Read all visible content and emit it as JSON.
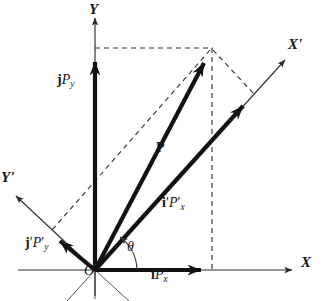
{
  "figure": {
    "kind": "vector-decomposition-diagram",
    "width": 322,
    "height": 301,
    "background_color": "#ffffff",
    "ink_color": "#171717",
    "thin_line_color": "#444444"
  },
  "axes": [
    {
      "id": "x-axis",
      "label": "X",
      "label_x": 302,
      "label_y": 262,
      "from": [
        18,
        270
      ],
      "to": [
        295,
        270
      ],
      "arrow": "end",
      "style": "thin-solid"
    },
    {
      "id": "y-axis",
      "label": "Y",
      "label_x": 89,
      "label_y": 3,
      "from": [
        95,
        296
      ],
      "to": [
        95,
        14
      ],
      "arrow": "end",
      "style": "thin-solid"
    },
    {
      "id": "x-prime-axis",
      "label": "X'",
      "label_x": 290,
      "label_y": 44,
      "from": [
        95,
        270
      ],
      "to": [
        287,
        58
      ],
      "arrow": "end",
      "style": "thin-solid"
    },
    {
      "id": "y-prime-axis",
      "label": "Y'",
      "label_x": 2,
      "label_y": 177,
      "from": [
        95,
        270
      ],
      "to": [
        13,
        193
      ],
      "arrow": "end",
      "style": "thin-solid"
    }
  ],
  "origin": {
    "label": "O",
    "x": 95,
    "y": 270,
    "label_x": 85,
    "label_y": 272
  },
  "angle": {
    "symbol": "θ",
    "label_x": 128,
    "label_y": 246,
    "vertex": [
      95,
      270
    ],
    "from_axis": "x-axis",
    "to_vector": "i'P'x",
    "radius": 40
  },
  "vectors": [
    {
      "id": "P",
      "label_plain": "P",
      "label_x": 157,
      "label_y": 148,
      "from": [
        95,
        270
      ],
      "to": [
        212,
        48
      ],
      "style": "thick-solid",
      "arrow": "end"
    },
    {
      "id": "iPx",
      "label_x": 152,
      "label_y": 275,
      "parts": [
        {
          "text": "i",
          "style": "bold"
        },
        {
          "text": "P",
          "style": "italic"
        },
        {
          "text": "x",
          "style": "subscript"
        }
      ],
      "from": [
        95,
        270
      ],
      "to": [
        212,
        270
      ],
      "style": "thick-solid",
      "arrow": "end"
    },
    {
      "id": "jPy",
      "label_x": 58,
      "label_y": 80,
      "parts": [
        {
          "text": "j",
          "style": "bold"
        },
        {
          "text": "P",
          "style": "italic"
        },
        {
          "text": "y",
          "style": "subscript"
        }
      ],
      "from": [
        95,
        270
      ],
      "to": [
        95,
        49
      ],
      "style": "thick-solid",
      "arrow": "end"
    },
    {
      "id": "i'P'x",
      "label_x": 163,
      "label_y": 203,
      "parts": [
        {
          "text": "i",
          "style": "bold"
        },
        {
          "text": "'",
          "style": "prime"
        },
        {
          "text": "P",
          "style": "italic"
        },
        {
          "text": "'",
          "style": "prime"
        },
        {
          "text": "x",
          "style": "subscript"
        }
      ],
      "from": [
        95,
        270
      ],
      "to": [
        252,
        96
      ],
      "style": "thick-solid",
      "arrow": "end"
    },
    {
      "id": "j'P'y",
      "label_x": 26,
      "label_y": 243,
      "parts": [
        {
          "text": "j",
          "style": "bold"
        },
        {
          "text": "'",
          "style": "prime"
        },
        {
          "text": "P",
          "style": "italic"
        },
        {
          "text": "'",
          "style": "prime"
        },
        {
          "text": "y",
          "style": "subscript"
        }
      ],
      "from": [
        95,
        270
      ],
      "to": [
        50,
        232
      ],
      "style": "thick-solid",
      "arrow": "end"
    }
  ],
  "construction_lines": [
    {
      "id": "dash-top-horizontal",
      "from": [
        95,
        48
      ],
      "to": [
        212,
        48
      ],
      "style": "dashed"
    },
    {
      "id": "dash-right-vertical",
      "from": [
        212,
        48
      ],
      "to": [
        212,
        270
      ],
      "style": "dashed"
    },
    {
      "id": "dash-p-to-jpy-prime",
      "from": [
        212,
        48
      ],
      "to": [
        50,
        232
      ],
      "style": "dashed"
    },
    {
      "id": "dash-p-to-ipx-prime",
      "from": [
        212,
        48
      ],
      "to": [
        253,
        95
      ],
      "style": "dashed"
    }
  ],
  "negative_axis_stubs": [
    {
      "id": "y-axis-below-origin",
      "from": [
        95,
        270
      ],
      "to": [
        95,
        298
      ],
      "style": "thin-solid"
    },
    {
      "id": "x-prime-negative-stub",
      "from": [
        95,
        270
      ],
      "to": [
        68,
        300
      ],
      "style": "thin-solid"
    },
    {
      "id": "y-prime-negative-stub",
      "from": [
        95,
        270
      ],
      "to": [
        128,
        300
      ],
      "style": "thin-solid"
    }
  ]
}
